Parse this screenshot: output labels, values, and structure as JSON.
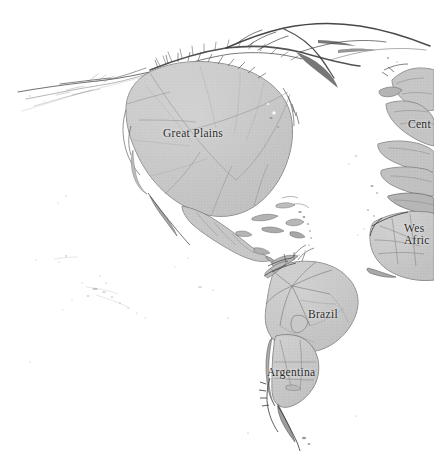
{
  "figure": {
    "type": "cartogram-map",
    "title": "",
    "background_color": "#ffffff",
    "land_fill_color": "#c9c9c9",
    "land_edge_color": "#6e6e6e",
    "filament_color": "#3d3d3d",
    "label_color": "#2b2b2b",
    "width": 434,
    "height": 454
  },
  "labels": {
    "great_plains": "Great Plains",
    "brazil": "Brazil",
    "argentina": "Argentina",
    "central_clipped": "Cent",
    "west_africa_line1": "Wes",
    "west_africa_line2": "Afric"
  },
  "regions": [
    {
      "id": "great-plains",
      "name": "Great Plains",
      "label": "Great Plains",
      "label_visible": true,
      "clipped": false
    },
    {
      "id": "mexico-central-america",
      "name": "Mexico and Central America",
      "label": "",
      "label_visible": false,
      "clipped": false
    },
    {
      "id": "caribbean-islands",
      "name": "Caribbean Islands",
      "label": "",
      "label_visible": false,
      "clipped": false
    },
    {
      "id": "brazil",
      "name": "Brazil",
      "label": "Brazil",
      "label_visible": true,
      "clipped": false
    },
    {
      "id": "argentina",
      "name": "Argentina",
      "label": "Argentina",
      "label_visible": true,
      "clipped": false
    },
    {
      "id": "central-clipped",
      "name": "Central (clipped at right edge)",
      "label": "Cent",
      "label_visible": true,
      "clipped": true
    },
    {
      "id": "west-africa",
      "name": "West Africa (clipped at right edge)",
      "label": "Wes Afric",
      "label_visible": true,
      "clipped": true
    },
    {
      "id": "northern-filaments",
      "name": "Northern arctic filaments",
      "label": "",
      "label_visible": false,
      "clipped": false
    },
    {
      "id": "western-filaments",
      "name": "Western filaments",
      "label": "",
      "label_visible": false,
      "clipped": false
    },
    {
      "id": "pacific-specks",
      "name": "Pacific island specks",
      "label": "",
      "label_visible": false,
      "clipped": false
    }
  ]
}
